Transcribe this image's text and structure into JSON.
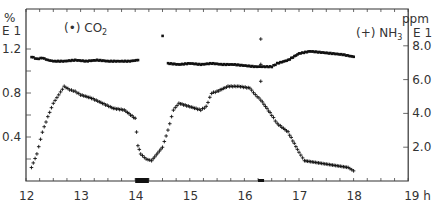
{
  "chart_data": {
    "type": "scatter",
    "title": "",
    "xlabel": "h",
    "x_ticks": [
      "12",
      "13",
      "14",
      "15",
      "16",
      "17",
      "18",
      "19 h"
    ],
    "xlim": [
      12,
      19
    ],
    "left_axis": {
      "unit": "%",
      "scale": "E 1",
      "ticks": [
        "0.4",
        "0.8",
        "1.2"
      ],
      "ylim": [
        0,
        1.4
      ]
    },
    "right_axis": {
      "unit": "ppm",
      "scale": "E 1",
      "ticks": [
        "2.0",
        "4.0",
        "6.0",
        "8.0"
      ],
      "ylim": [
        0,
        8.5
      ]
    },
    "legend": [
      {
        "marker": "(•)",
        "name": "CO2",
        "axis": "left"
      },
      {
        "marker": "(+)",
        "name": "NH3",
        "axis": "right"
      }
    ],
    "series": [
      {
        "name": "CO2",
        "marker": "dot",
        "axis": "left",
        "x": [
          12.1,
          12.2,
          12.3,
          12.4,
          12.5,
          12.7,
          12.9,
          13.1,
          13.3,
          13.5,
          13.7,
          13.9,
          14.05,
          14.6,
          14.8,
          15.0,
          15.2,
          15.4,
          15.6,
          15.8,
          16.0,
          16.2,
          16.5,
          16.6,
          16.8,
          17.0,
          17.2,
          17.4,
          17.6,
          17.8,
          18.0
        ],
        "y": [
          1.13,
          1.11,
          1.12,
          1.1,
          1.09,
          1.09,
          1.1,
          1.09,
          1.1,
          1.09,
          1.09,
          1.09,
          1.1,
          1.07,
          1.06,
          1.07,
          1.06,
          1.07,
          1.06,
          1.06,
          1.05,
          1.04,
          1.04,
          1.07,
          1.1,
          1.16,
          1.18,
          1.17,
          1.16,
          1.15,
          1.13
        ]
      },
      {
        "name": "NH3",
        "marker": "plus",
        "axis": "right",
        "x": [
          12.1,
          12.2,
          12.3,
          12.4,
          12.5,
          12.6,
          12.7,
          12.8,
          12.9,
          13.0,
          13.2,
          13.4,
          13.6,
          13.8,
          14.0,
          14.05,
          14.1,
          14.2,
          14.3,
          14.5,
          14.6,
          14.7,
          14.8,
          15.0,
          15.2,
          15.3,
          15.4,
          15.5,
          15.7,
          15.9,
          16.1,
          16.2,
          16.3,
          16.5,
          16.6,
          16.8,
          17.0,
          17.1,
          17.3,
          17.5,
          17.7,
          17.9,
          18.0
        ],
        "y": [
          0.8,
          1.6,
          2.9,
          3.8,
          4.6,
          5.1,
          5.6,
          5.4,
          5.3,
          5.1,
          4.9,
          4.6,
          4.3,
          4.2,
          3.7,
          2.1,
          1.6,
          1.3,
          1.2,
          2.0,
          3.0,
          4.2,
          4.6,
          4.4,
          4.2,
          4.4,
          5.2,
          5.3,
          5.6,
          5.6,
          5.5,
          5.1,
          4.8,
          3.9,
          3.4,
          2.9,
          1.7,
          1.2,
          1.1,
          1.0,
          0.9,
          0.8,
          0.6
        ]
      },
      {
        "name": "NH3 outliers",
        "marker": "plus",
        "axis": "right",
        "x": [
          16.3,
          16.3,
          16.3
        ],
        "y": [
          8.4,
          6.9,
          5.9
        ]
      },
      {
        "name": "CO2 outliers",
        "marker": "dot",
        "axis": "left",
        "x": [
          14.5
        ],
        "y": [
          1.32
        ]
      }
    ],
    "annotations": [
      "black bar on x-axis around 14.0-14.25 h"
    ]
  }
}
